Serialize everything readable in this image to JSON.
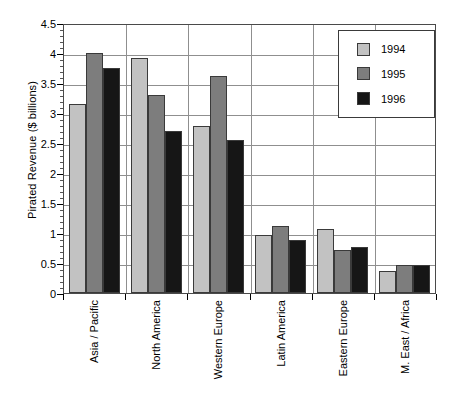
{
  "chart_data": {
    "type": "bar",
    "title": "",
    "xlabel": "",
    "ylabel": "Pirated Revenue ($ billions)",
    "ylim": [
      0,
      4.5
    ],
    "ytick_step": 0.5,
    "yticks": [
      "0",
      "0.5",
      "1",
      "1.5",
      "2",
      "2.5",
      "3",
      "3.5",
      "4",
      "4.5"
    ],
    "ytick_values": [
      0,
      0.5,
      1,
      1.5,
      2,
      2.5,
      3,
      3.5,
      4,
      4.5
    ],
    "grid": true,
    "legend_position": "top-right",
    "categories": [
      "Asia / Pacific",
      "North America",
      "Western Europe",
      "Latin America",
      "Eastern Europe",
      "M. East / Africa"
    ],
    "series": [
      {
        "name": "1994",
        "color": "#c2c2c2",
        "values": [
          3.15,
          3.92,
          2.78,
          0.97,
          1.07,
          0.36
        ]
      },
      {
        "name": "1995",
        "color": "#7d7d7d",
        "values": [
          4.0,
          3.3,
          3.62,
          1.12,
          0.72,
          0.47
        ]
      },
      {
        "name": "1996",
        "color": "#161616",
        "values": [
          3.75,
          2.7,
          2.55,
          0.88,
          0.76,
          0.46
        ]
      }
    ]
  },
  "legend": {
    "items": [
      {
        "label": "1994"
      },
      {
        "label": "1995"
      },
      {
        "label": "1996"
      }
    ]
  }
}
